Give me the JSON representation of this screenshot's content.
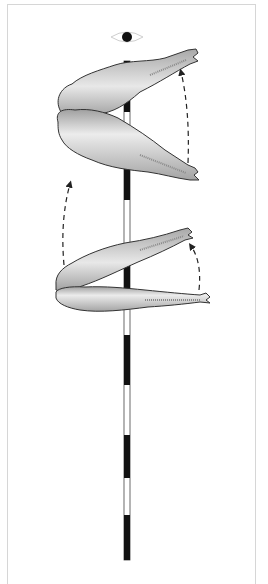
{
  "figure": {
    "labels": [],
    "colors": {
      "background": "#ffffff",
      "frame": "#d6d6d6",
      "pole_dark": "#111111",
      "pole_light": "#ffffff",
      "carcass_fill": "#bdbdbd",
      "carcass_highlight": "#e6e6e6",
      "carcass_outline": "#333333",
      "arrow": "#222222"
    },
    "elements": {
      "eye": {
        "name": "viewpoint-eye",
        "x": 127,
        "y": 37
      },
      "pole": {
        "x": 124,
        "width": 6,
        "top": 61,
        "bottom": 560,
        "segments": [
          {
            "from": 61,
            "to": 112,
            "color": "dark"
          },
          {
            "from": 112,
            "to": 147,
            "color": "light"
          },
          {
            "from": 147,
            "to": 200,
            "color": "dark"
          },
          {
            "from": 200,
            "to": 250,
            "color": "light"
          },
          {
            "from": 250,
            "to": 300,
            "color": "dark"
          },
          {
            "from": 300,
            "to": 335,
            "color": "light"
          },
          {
            "from": 335,
            "to": 385,
            "color": "dark"
          },
          {
            "from": 385,
            "to": 435,
            "color": "light"
          },
          {
            "from": 435,
            "to": 478,
            "color": "dark"
          },
          {
            "from": 478,
            "to": 515,
            "color": "light"
          },
          {
            "from": 515,
            "to": 560,
            "color": "dark"
          }
        ]
      },
      "upper_pair": {
        "upper_carcass_leg_tip": [
          196,
          55
        ],
        "lower_carcass_leg_tip": [
          197,
          177
        ],
        "hip": [
          55,
          120
        ]
      },
      "lower_pair": {
        "upper_carcass_leg_tip": [
          195,
          232
        ],
        "lower_carcass_leg_tip": [
          207,
          300
        ],
        "hip": [
          55,
          290
        ]
      },
      "arrows": [
        {
          "name": "arrow-upper-right",
          "from": [
            188,
            165
          ],
          "to": [
            181,
            72
          ]
        },
        {
          "name": "arrow-left",
          "from": [
            64,
            265
          ],
          "to": [
            70,
            183
          ]
        },
        {
          "name": "arrow-lower-right",
          "from": [
            200,
            292
          ],
          "to": [
            190,
            245
          ]
        }
      ]
    }
  }
}
